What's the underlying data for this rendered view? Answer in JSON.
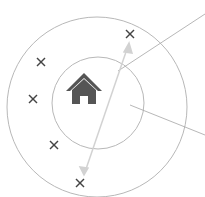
{
  "diagram": {
    "colors": {
      "circle": "#b5b5b5",
      "marker": "#444444",
      "home": "#555555",
      "arrow": "#cfcfcf",
      "leader": "#9a9a9a"
    },
    "markers": [
      {
        "x": 130,
        "y": 34
      },
      {
        "x": 41,
        "y": 62
      },
      {
        "x": 33,
        "y": 99
      },
      {
        "x": 54,
        "y": 145
      },
      {
        "x": 80,
        "y": 183
      }
    ],
    "icon": "home-icon"
  }
}
